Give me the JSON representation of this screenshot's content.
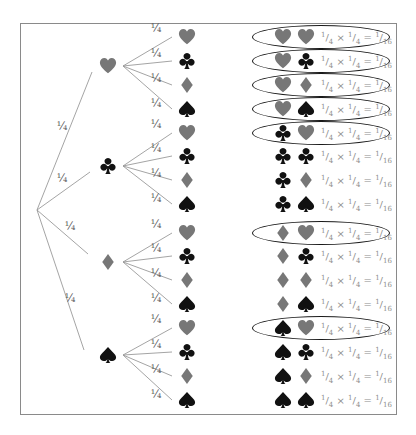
{
  "colors": {
    "red_suit": "#777777",
    "black_suit": "#111111",
    "line": "#9a9a9a",
    "ring": "#1a1a1a",
    "equation": "#8c8c8c"
  },
  "first_level": {
    "probability": "¼",
    "nodes": [
      {
        "suit": "heart",
        "icon": "heart-icon"
      },
      {
        "suit": "club",
        "icon": "club-icon"
      },
      {
        "suit": "diamond",
        "icon": "diamond-icon"
      },
      {
        "suit": "spade",
        "icon": "spade-icon"
      }
    ]
  },
  "second_level": {
    "probability": "¼",
    "suits": [
      "heart",
      "club",
      "diamond",
      "spade"
    ]
  },
  "equation": {
    "a_num": "1",
    "a_den": "4",
    "times": "×",
    "b_num": "1",
    "b_den": "4",
    "equals": "=",
    "c_num": "1",
    "c_den": "16"
  },
  "outcomes": [
    {
      "first": "heart",
      "second": "heart",
      "circled": true
    },
    {
      "first": "heart",
      "second": "club",
      "circled": true
    },
    {
      "first": "heart",
      "second": "diamond",
      "circled": true
    },
    {
      "first": "heart",
      "second": "spade",
      "circled": true
    },
    {
      "first": "club",
      "second": "heart",
      "circled": true
    },
    {
      "first": "club",
      "second": "club",
      "circled": false
    },
    {
      "first": "club",
      "second": "diamond",
      "circled": false
    },
    {
      "first": "club",
      "second": "spade",
      "circled": false
    },
    {
      "first": "diamond",
      "second": "heart",
      "circled": true
    },
    {
      "first": "diamond",
      "second": "club",
      "circled": false
    },
    {
      "first": "diamond",
      "second": "diamond",
      "circled": false
    },
    {
      "first": "diamond",
      "second": "spade",
      "circled": false
    },
    {
      "first": "spade",
      "second": "heart",
      "circled": true
    },
    {
      "first": "spade",
      "second": "club",
      "circled": false
    },
    {
      "first": "spade",
      "second": "diamond",
      "circled": false
    },
    {
      "first": "spade",
      "second": "spade",
      "circled": false
    }
  ]
}
